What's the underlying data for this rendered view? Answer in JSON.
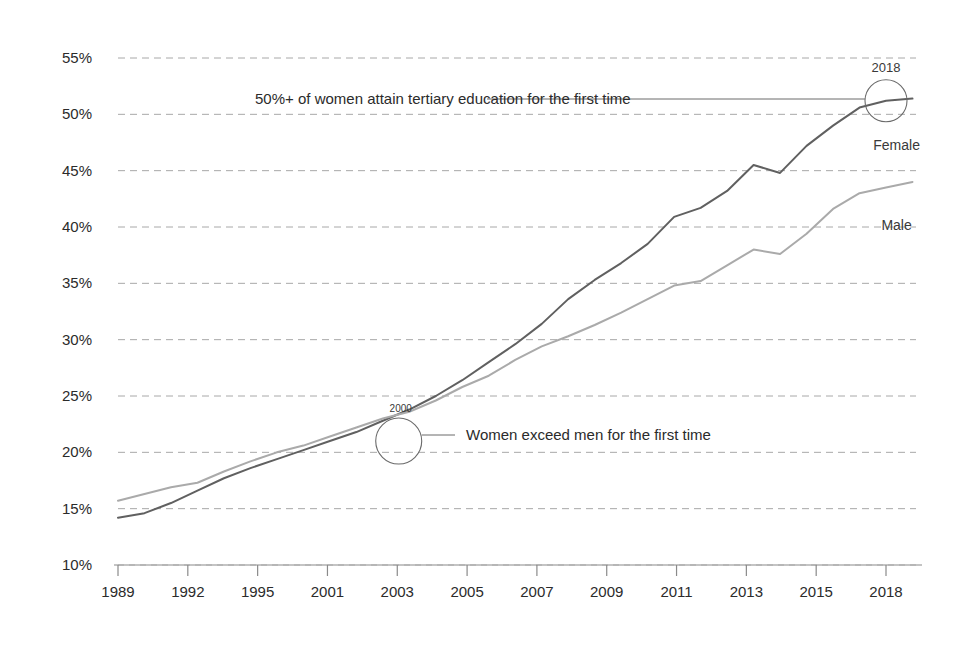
{
  "chart_data": {
    "type": "line",
    "title": "",
    "subtitle": "",
    "xlabel": "",
    "ylabel": "",
    "grid": true,
    "legend_position": "inline-right",
    "xlim": [
      1989,
      2019.5
    ],
    "ylim": [
      10,
      56
    ],
    "y_ticks": [
      "10%",
      "15%",
      "20%",
      "25%",
      "30%",
      "35%",
      "40%",
      "45%",
      "50%",
      "55%"
    ],
    "y_tick_values": [
      10,
      15,
      20,
      25,
      30,
      35,
      40,
      45,
      50,
      55
    ],
    "x_tick_labels": [
      "1989",
      "1992",
      "1995",
      "2001",
      "2003",
      "2005",
      "2007",
      "2009",
      "2011",
      "2013",
      "2015",
      "2018"
    ],
    "x_tick_values": [
      1989,
      1992,
      1995,
      2001,
      2003,
      2005,
      2007,
      2009,
      2011,
      2013,
      2015,
      2018
    ],
    "x": [
      1989,
      1990,
      1991,
      1992,
      1993,
      1994,
      1995,
      1996,
      1997,
      1998,
      1999,
      2000,
      2001,
      2002,
      2003,
      2004,
      2005,
      2006,
      2007,
      2008,
      2009,
      2010,
      2011,
      2012,
      2013,
      2014,
      2015,
      2016,
      2017,
      2018,
      2019
    ],
    "series": [
      {
        "name": "Female",
        "color": "#606060",
        "values": [
          14.2,
          14.6,
          15.5,
          16.6,
          17.7,
          18.6,
          19.4,
          20.2,
          21.0,
          21.8,
          22.8,
          23.8,
          25.0,
          26.4,
          28.0,
          29.6,
          31.4,
          33.6,
          35.3,
          36.8,
          38.5,
          40.9,
          41.7,
          43.2,
          45.5,
          44.8,
          47.2,
          49.0,
          50.6,
          51.2,
          51.4
        ]
      },
      {
        "name": "Male",
        "color": "#aaaaaa",
        "values": [
          15.7,
          16.3,
          16.9,
          17.3,
          18.3,
          19.2,
          20.0,
          20.6,
          21.4,
          22.2,
          23.0,
          23.6,
          24.6,
          25.8,
          26.8,
          28.2,
          29.4,
          30.3,
          31.3,
          32.4,
          33.6,
          34.8,
          35.2,
          36.6,
          38.0,
          37.6,
          39.4,
          41.6,
          43.0,
          43.5,
          44.0
        ]
      }
    ],
    "annotations": [
      {
        "id": "crossover",
        "marker_year": "2000",
        "text": "Women exceed men for the first time",
        "point_x": 1999.6,
        "point_y": 21.8
      },
      {
        "id": "fifty-percent",
        "marker_year": "2018",
        "text": "50%+ of women attain tertiary education for the first time",
        "point_x": 2018,
        "point_y": 51.2
      }
    ],
    "series_labels": [
      {
        "name": "Female",
        "x": 2018.4,
        "y": 47.3
      },
      {
        "name": "Male",
        "x": 2018.4,
        "y": 40.2
      }
    ]
  },
  "style": {
    "background": "#ffffff",
    "grid_color": "#9a9a9a",
    "axis_color": "#8a8a8a",
    "text_color": "#2b2b2b",
    "female_color": "#606060",
    "male_color": "#aaaaaa"
  }
}
